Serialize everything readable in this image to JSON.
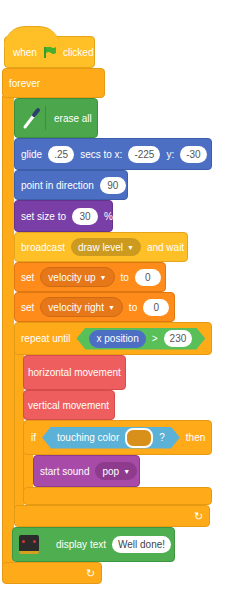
{
  "script": {
    "hat": {
      "when": "when",
      "clicked": "clicked",
      "icon": "green-flag-icon"
    },
    "forever": {
      "label": "forever",
      "loop_icon": "↻"
    },
    "erase_all": {
      "label": "erase all",
      "icon": "pen-icon"
    },
    "glide": {
      "label1": "glide",
      "secs": ".25",
      "label2": "secs to x:",
      "x": "-225",
      "label3": "y:",
      "y": "-30"
    },
    "point_direction": {
      "label": "point in direction",
      "value": "90"
    },
    "set_size": {
      "label": "set size to",
      "value": "30",
      "unit": "%"
    },
    "broadcast": {
      "label": "broadcast",
      "message": "draw level",
      "suffix": "and wait"
    },
    "set_velocity_up": {
      "label": "set",
      "variable": "velocity up",
      "to": "to",
      "value": "0"
    },
    "set_velocity_right": {
      "label": "set",
      "variable": "velocity right",
      "to": "to",
      "value": "0"
    },
    "repeat_until": {
      "label": "repeat until",
      "reporter": "x position",
      "operator": ">",
      "value": "230"
    },
    "horizontal_movement": {
      "label": "horizontal movement"
    },
    "vertical_movement": {
      "label": "vertical movement"
    },
    "if_block": {
      "label": "if",
      "condition": "touching color",
      "question": "?",
      "then": "then",
      "color": "#d9901a"
    },
    "start_sound": {
      "label": "start sound",
      "sound": "pop"
    },
    "display_text": {
      "label": "display text",
      "value": "Well done!",
      "icon": "microbit-icon"
    }
  },
  "colors": {
    "events": "#ffbf26",
    "control": "#ffab19",
    "pen": "#4ca74c",
    "motion": "#4c6fc4",
    "looks": "#7a3fa6",
    "variables": "#ff8c1a",
    "my_blocks": "#ef5e5e",
    "sound": "#a84aa8",
    "sensing": "#5cb1d6",
    "operators": "#59c059"
  }
}
